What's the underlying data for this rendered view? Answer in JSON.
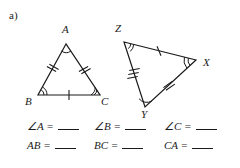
{
  "problem": {
    "part_label": "a)"
  },
  "figures": {
    "triangle_abc": {
      "name": "triangle-abc",
      "vertices": [
        {
          "label": "A",
          "x": 66,
          "y": 44,
          "label_x": 62,
          "label_y": 24,
          "angle_arcs": 1
        },
        {
          "label": "B",
          "x": 38,
          "y": 95,
          "label_x": 25,
          "label_y": 96,
          "angle_arcs": 2
        },
        {
          "label": "C",
          "x": 100,
          "y": 95,
          "label_x": 101,
          "label_y": 96,
          "angle_arcs": 2
        }
      ],
      "sides": [
        {
          "from": "A",
          "to": "B",
          "ticks": 2
        },
        {
          "from": "A",
          "to": "C",
          "ticks": 2
        },
        {
          "from": "B",
          "to": "C",
          "ticks": 1
        }
      ]
    },
    "triangle_xyz": {
      "name": "triangle-xyz",
      "vertices": [
        {
          "label": "Z",
          "x": 124,
          "y": 42,
          "label_x": 115,
          "label_y": 23,
          "angle_arcs": 2
        },
        {
          "label": "X",
          "x": 196,
          "y": 60,
          "label_x": 203,
          "label_y": 57,
          "angle_arcs": 2
        },
        {
          "label": "Y",
          "x": 145,
          "y": 107,
          "label_x": 141,
          "label_y": 109,
          "angle_arcs": 1
        }
      ],
      "sides": [
        {
          "from": "Z",
          "to": "X",
          "ticks": 1
        },
        {
          "from": "Z",
          "to": "Y",
          "ticks": 3
        },
        {
          "from": "Y",
          "to": "X",
          "ticks": 2
        }
      ]
    }
  },
  "answers": {
    "row_angles": [
      {
        "label": "∠A =",
        "value": ""
      },
      {
        "label": "∠B =",
        "value": ""
      },
      {
        "label": "∠C =",
        "value": ""
      }
    ],
    "row_sides": [
      {
        "label": "AB =",
        "value": ""
      },
      {
        "label": "BC =",
        "value": ""
      },
      {
        "label": "CA =",
        "value": ""
      }
    ]
  },
  "style": {
    "ink": "#1a1a1a",
    "background": "#ffffff"
  }
}
